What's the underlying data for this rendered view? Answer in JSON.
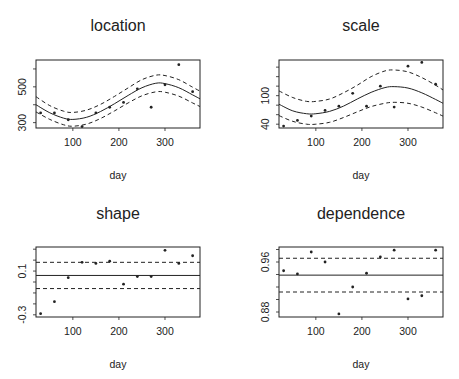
{
  "figure": {
    "width": 459,
    "height": 379,
    "background": "#ffffff",
    "ink": "#222222"
  },
  "chart_data": [
    {
      "type": "scatter",
      "title": "location",
      "xlabel": "day",
      "ylabel": "",
      "xlim": [
        20,
        376
      ],
      "ylim": [
        270,
        650
      ],
      "xticks": [
        100,
        200,
        300
      ],
      "yticks": [
        300,
        400,
        500,
        600
      ],
      "ytick_labels": [
        {
          "v": 300,
          "label": "300"
        },
        {
          "v": 500,
          "label": "500"
        }
      ],
      "box": {
        "left": 36,
        "top": 60,
        "right": 200,
        "bottom": 128
      },
      "points": {
        "x": [
          30,
          60,
          90,
          120,
          150,
          180,
          210,
          240,
          270,
          300,
          330,
          360
        ],
        "y": [
          354,
          354,
          316,
          278,
          354,
          386,
          413,
          489,
          386,
          511,
          624,
          473
        ]
      },
      "fit": {
        "style": "solid",
        "x": [
          20,
          50,
          80,
          100,
          130,
          160,
          190,
          220,
          250,
          280,
          300,
          330,
          360,
          376
        ],
        "y": [
          400,
          355,
          325,
          318,
          330,
          362,
          405,
          452,
          495,
          520,
          518,
          495,
          455,
          433
        ]
      },
      "upper": {
        "style": "dashed",
        "x": [
          20,
          50,
          80,
          100,
          130,
          160,
          190,
          220,
          250,
          280,
          300,
          330,
          360,
          376
        ],
        "y": [
          445,
          395,
          364,
          357,
          370,
          402,
          446,
          494,
          540,
          565,
          563,
          540,
          498,
          476
        ]
      },
      "lower": {
        "style": "dashed",
        "x": [
          20,
          50,
          80,
          100,
          130,
          160,
          190,
          220,
          250,
          280,
          300,
          330,
          360,
          376
        ],
        "y": [
          360,
          318,
          288,
          280,
          292,
          323,
          365,
          410,
          450,
          472,
          470,
          448,
          410,
          390
        ]
      }
    },
    {
      "type": "scatter",
      "title": "scale",
      "xlabel": "day",
      "ylabel": "",
      "xlim": [
        20,
        376
      ],
      "ylim": [
        32,
        175
      ],
      "xticks": [
        100,
        200,
        300
      ],
      "yticks": [
        40,
        60,
        80,
        100,
        120,
        140,
        160
      ],
      "ytick_labels": [
        {
          "v": 40,
          "label": "40"
        },
        {
          "v": 100,
          "label": "100"
        }
      ],
      "box": {
        "left": 279,
        "top": 60,
        "right": 443,
        "bottom": 128
      },
      "points": {
        "x": [
          30,
          60,
          90,
          120,
          150,
          180,
          210,
          240,
          270,
          300,
          330,
          360
        ],
        "y": [
          36,
          48,
          57,
          69,
          78,
          105,
          78,
          120,
          76,
          162,
          170,
          124
        ]
      },
      "fit": {
        "style": "solid",
        "x": [
          20,
          50,
          80,
          100,
          130,
          160,
          190,
          220,
          250,
          270,
          300,
          330,
          360,
          376
        ],
        "y": [
          82,
          68,
          62,
          62,
          67,
          78,
          93,
          107,
          117,
          119,
          116,
          106,
          92,
          84
        ]
      },
      "upper": {
        "style": "dashed",
        "x": [
          20,
          50,
          80,
          100,
          130,
          160,
          190,
          220,
          250,
          270,
          300,
          330,
          360,
          376
        ],
        "y": [
          110,
          96,
          88,
          88,
          93,
          106,
          122,
          140,
          152,
          154,
          150,
          138,
          122,
          112
        ]
      },
      "lower": {
        "style": "dashed",
        "x": [
          20,
          50,
          80,
          100,
          130,
          160,
          190,
          220,
          250,
          270,
          300,
          330,
          360,
          376
        ],
        "y": [
          58,
          46,
          40,
          40,
          44,
          54,
          66,
          77,
          84,
          86,
          84,
          76,
          64,
          57
        ]
      }
    },
    {
      "type": "scatter",
      "title": "shape",
      "xlabel": "day",
      "ylabel": "",
      "xlim": [
        20,
        376
      ],
      "ylim": [
        -0.32,
        0.32
      ],
      "xticks": [
        100,
        200,
        300
      ],
      "yticks": [
        -0.3,
        -0.2,
        -0.1,
        0.0,
        0.1,
        0.2,
        0.3
      ],
      "ytick_labels": [
        {
          "v": -0.3,
          "label": "-0.3"
        },
        {
          "v": 0.1,
          "label": "0.1"
        }
      ],
      "box": {
        "left": 36,
        "top": 247,
        "right": 200,
        "bottom": 317
      },
      "points": {
        "x": [
          30,
          60,
          90,
          120,
          150,
          180,
          210,
          240,
          270,
          300,
          330,
          360
        ],
        "y": [
          -0.29,
          -0.18,
          0.04,
          0.18,
          0.17,
          0.19,
          -0.02,
          0.05,
          0.05,
          0.29,
          0.17,
          0.24
        ]
      },
      "hlines": [
        {
          "y": 0.06,
          "style": "solid"
        },
        {
          "y": 0.18,
          "style": "dashed"
        },
        {
          "y": -0.06,
          "style": "dashed"
        }
      ]
    },
    {
      "type": "scatter",
      "title": "dependence",
      "xlabel": "day",
      "ylabel": "",
      "xlim": [
        20,
        376
      ],
      "ylim": [
        0.872,
        0.984
      ],
      "xticks": [
        100,
        200,
        300
      ],
      "yticks": [
        0.88,
        0.9,
        0.92,
        0.94,
        0.96,
        0.98
      ],
      "ytick_labels": [
        {
          "v": 0.88,
          "label": "0.88"
        },
        {
          "v": 0.96,
          "label": "0.96"
        }
      ],
      "box": {
        "left": 279,
        "top": 247,
        "right": 443,
        "bottom": 317
      },
      "points": {
        "x": [
          30,
          60,
          90,
          120,
          150,
          180,
          210,
          240,
          270,
          300,
          330,
          360
        ],
        "y": [
          0.946,
          0.941,
          0.976,
          0.96,
          0.877,
          0.92,
          0.942,
          0.968,
          0.979,
          0.901,
          0.906,
          0.979
        ]
      },
      "hlines": [
        {
          "y": 0.939,
          "style": "solid"
        },
        {
          "y": 0.966,
          "style": "dashed"
        },
        {
          "y": 0.912,
          "style": "dashed"
        }
      ]
    }
  ]
}
